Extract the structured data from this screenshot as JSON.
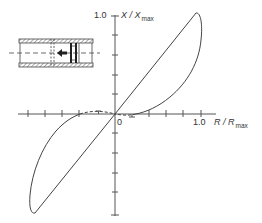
{
  "figure": {
    "type": "hysteresis-loop-diagram",
    "y_axis": {
      "label_var": "X / X",
      "label_sub": "max",
      "tick_label_top": "1.0",
      "ticks_above": 5,
      "ticks_below": 5
    },
    "x_axis": {
      "label_var": "R / R",
      "label_sub": "max",
      "tick_label_right": "1.0",
      "origin_label": "0",
      "ticks_left": 5,
      "ticks_right": 5
    },
    "inset": {
      "description": "pipe cross-section with piston and leftward arrow",
      "arrow_direction": "left"
    },
    "colors": {
      "line": "#444444",
      "text": "#333333",
      "background": "#ffffff"
    }
  }
}
